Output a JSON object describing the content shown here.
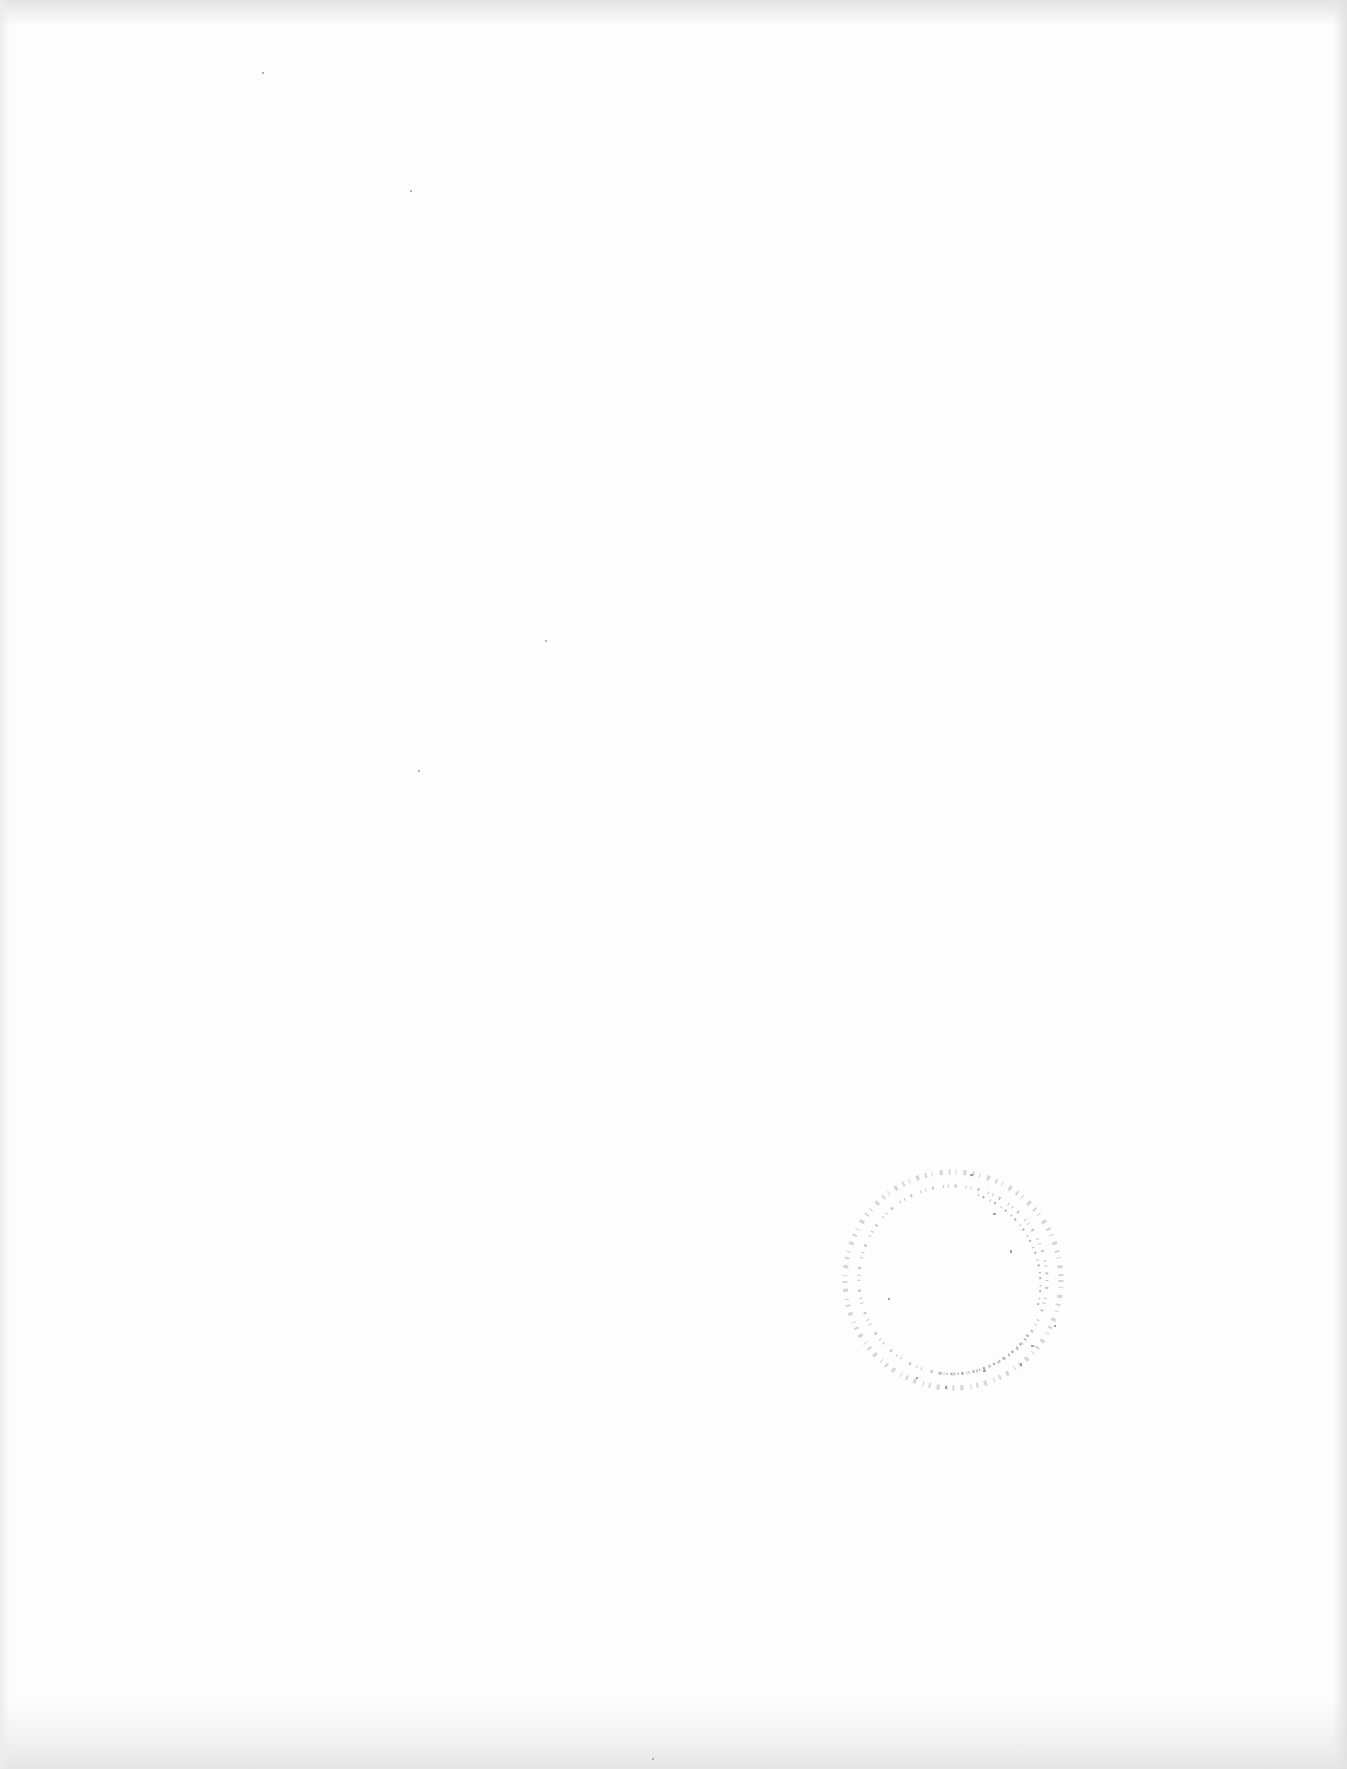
{
  "page": {
    "background": "#fdfdfd",
    "edge_shade": "#e4e4e4"
  },
  "stamp": {
    "shape": "circle",
    "color": "#9a9a9a",
    "text": ""
  },
  "specks": [
    {
      "x": 262,
      "y": 72
    },
    {
      "x": 410,
      "y": 190
    },
    {
      "x": 545,
      "y": 640
    },
    {
      "x": 418,
      "y": 770
    },
    {
      "x": 652,
      "y": 1758
    }
  ]
}
